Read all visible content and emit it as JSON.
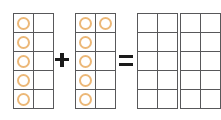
{
  "worksheet": {
    "type": "ten-frame-addition",
    "equation_text": "5 + 6 = ?",
    "background_color": "#ffffff",
    "grid_line_color": "#58585a",
    "counter_color": "#ecb878",
    "operator_color": "#1a1a1a"
  },
  "operators": {
    "plus": "+",
    "equals": "="
  },
  "frames": [
    {
      "id": "addend-1",
      "role": "addend",
      "label": "first-addend-ten-frame",
      "counter_count": 5,
      "rows": 5,
      "columns": 2,
      "cells": [
        [
          true,
          false
        ],
        [
          true,
          false
        ],
        [
          true,
          false
        ],
        [
          true,
          false
        ],
        [
          true,
          false
        ]
      ]
    },
    {
      "id": "addend-2",
      "role": "addend",
      "label": "second-addend-ten-frame",
      "counter_count": 6,
      "rows": 5,
      "columns": 2,
      "cells": [
        [
          true,
          true
        ],
        [
          true,
          false
        ],
        [
          true,
          false
        ],
        [
          true,
          false
        ],
        [
          true,
          false
        ]
      ]
    },
    {
      "id": "sum-1",
      "role": "answer",
      "label": "first-answer-ten-frame",
      "counter_count": 0,
      "rows": 5,
      "columns": 2,
      "cells": [
        [
          false,
          false
        ],
        [
          false,
          false
        ],
        [
          false,
          false
        ],
        [
          false,
          false
        ],
        [
          false,
          false
        ]
      ]
    },
    {
      "id": "sum-2",
      "role": "answer",
      "label": "second-answer-ten-frame",
      "counter_count": 0,
      "rows": 5,
      "columns": 2,
      "cells": [
        [
          false,
          false
        ],
        [
          false,
          false
        ],
        [
          false,
          false
        ],
        [
          false,
          false
        ],
        [
          false,
          false
        ]
      ]
    }
  ]
}
